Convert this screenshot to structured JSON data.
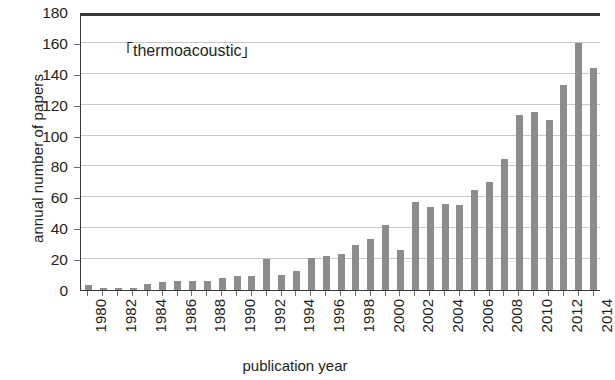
{
  "chart_data": {
    "type": "bar",
    "title": "",
    "annotation": "「thermoacoustic」",
    "xlabel": "publication year",
    "ylabel": "annual number of papers",
    "ylim": [
      0,
      180
    ],
    "ytick_step": 20,
    "yticks": [
      0,
      20,
      40,
      60,
      80,
      100,
      120,
      140,
      160,
      180
    ],
    "grid": true,
    "legend": "none",
    "bar_color": "#8c8c8c",
    "frame_color": "#3a3a3a",
    "gridline_color": "#c9c9c9",
    "xtick_labels": [
      "1980",
      "1982",
      "1984",
      "1986",
      "1988",
      "1990",
      "1992",
      "1994",
      "1996",
      "1998",
      "2000",
      "2002",
      "2004",
      "2006",
      "2008",
      "2010",
      "2012",
      "2014"
    ],
    "xtick_step": 2,
    "categories": [
      "1980",
      "1981",
      "1982",
      "1983",
      "1984",
      "1985",
      "1986",
      "1987",
      "1988",
      "1989",
      "1990",
      "1991",
      "1992",
      "1993",
      "1994",
      "1995",
      "1996",
      "1997",
      "1998",
      "1999",
      "2000",
      "2001",
      "2002",
      "2003",
      "2004",
      "2005",
      "2006",
      "2007",
      "2008",
      "2009",
      "2010",
      "2011",
      "2012",
      "2013",
      "2014"
    ],
    "values": [
      3,
      1,
      1,
      1,
      4,
      5,
      6,
      6,
      6,
      8,
      9,
      9,
      20,
      10,
      12,
      21,
      22,
      23,
      29,
      33,
      42,
      26,
      57,
      54,
      56,
      55,
      65,
      70,
      85,
      113,
      115,
      110,
      133,
      160,
      144
    ]
  }
}
